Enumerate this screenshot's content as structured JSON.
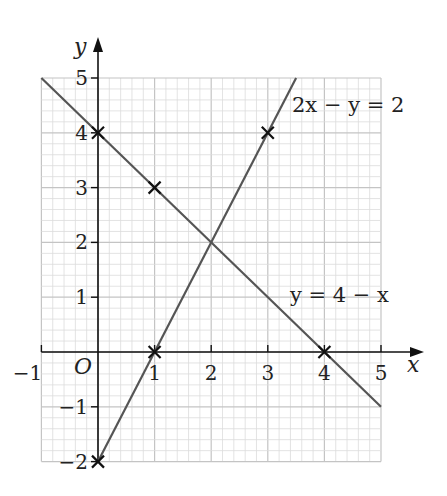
{
  "chart_data": {
    "type": "line",
    "title": "",
    "xlabel": "x",
    "ylabel": "y",
    "origin_label": "O",
    "xlim": [
      -1,
      5
    ],
    "ylim": [
      -2,
      5
    ],
    "grid": true,
    "grid_minor_per_unit": 5,
    "x_ticks": [
      -1,
      1,
      2,
      3,
      4,
      5
    ],
    "x_tick_labels": [
      "−1",
      "1",
      "2",
      "3",
      "4",
      "5"
    ],
    "y_ticks": [
      -2,
      -1,
      1,
      2,
      3,
      4,
      5
    ],
    "y_tick_labels": [
      "−2",
      "−1",
      "1",
      "2",
      "3",
      "4",
      "5"
    ],
    "series": [
      {
        "name": "y = 4 − x",
        "label": "y = 4 − x",
        "x": [
          -1,
          5
        ],
        "y": [
          5,
          -1
        ],
        "marked_points": [
          [
            0,
            4
          ],
          [
            1,
            3
          ],
          [
            4,
            0
          ]
        ]
      },
      {
        "name": "2x − y = 2",
        "label": "2x − y = 2",
        "x": [
          0,
          3.5
        ],
        "y": [
          -2,
          5
        ],
        "marked_points": [
          [
            0,
            -2
          ],
          [
            1,
            0
          ],
          [
            3,
            4
          ]
        ]
      }
    ],
    "intersection": [
      2,
      2
    ]
  },
  "colors": {
    "line": "#555555",
    "axis": "#111111",
    "grid_minor": "#dcdcdc",
    "grid_major": "#c4c4c4",
    "marker": "#111111"
  }
}
